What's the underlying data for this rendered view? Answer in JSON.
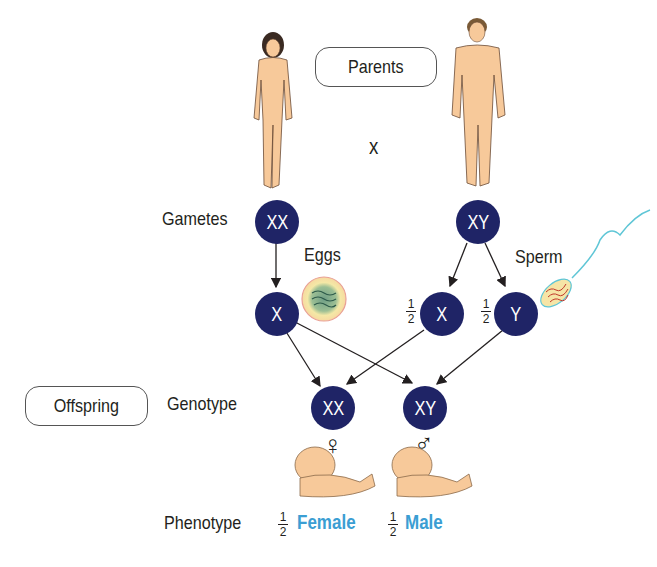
{
  "labels": {
    "parents": "Parents",
    "cross": "x",
    "gametes": "Gametes",
    "eggs": "Eggs",
    "sperm": "Sperm",
    "offspring": "Offspring",
    "genotype": "Genotype",
    "phenotype": "Phenotype"
  },
  "nodes": {
    "mother_gamete": "XX",
    "father_gamete": "XY",
    "egg_x": "X",
    "sperm_x": "X",
    "sperm_y": "Y",
    "offspring_female": "XX",
    "offspring_male": "XY"
  },
  "fractions": {
    "sperm_x": {
      "num": "1",
      "den": "2"
    },
    "sperm_y": {
      "num": "1",
      "den": "2"
    },
    "female": {
      "num": "1",
      "den": "2"
    },
    "male": {
      "num": "1",
      "den": "2"
    }
  },
  "symbols": {
    "female": "♀",
    "male": "♂"
  },
  "phenotypes": {
    "female": "Female",
    "male": "Male"
  },
  "colors": {
    "node": "#1f2466",
    "phenotype": "#3b9ed3",
    "skin": "#f7c99a"
  }
}
